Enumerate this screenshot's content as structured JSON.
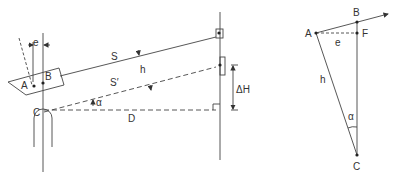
{
  "figure": {
    "left_panel": {
      "labels": {
        "e": "e",
        "A": "A",
        "B": "B",
        "C": "C",
        "S": "S",
        "S_prime": "S′",
        "h": "h",
        "alpha": "α",
        "D": "D",
        "delta_H": "ΔH"
      }
    },
    "right_panel": {
      "labels": {
        "A": "A",
        "B": "B",
        "F": "F",
        "e": "e",
        "h": "h",
        "alpha": "α",
        "C": "C"
      }
    },
    "colors": {
      "line": "#444444",
      "text": "#333333"
    }
  }
}
